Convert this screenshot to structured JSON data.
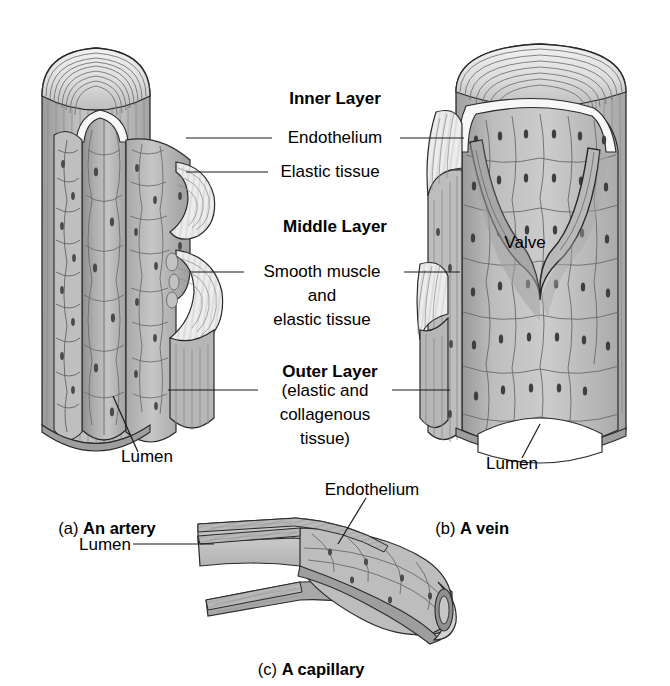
{
  "figure": {
    "background_color": "#ffffff",
    "line_color": "#1a1a1a",
    "fill_light": "#d8d8d8",
    "fill_mid": "#bdbdbd",
    "fill_dark": "#9c9c9c",
    "fill_darker": "#858585",
    "fill_white": "#f4f4f4"
  },
  "center_labels": {
    "inner_layer": "Inner Layer",
    "endothelium": "Endothelium",
    "elastic_tissue": "Elastic tissue",
    "middle_layer": "Middle Layer",
    "smooth_muscle_line1": "Smooth muscle",
    "smooth_muscle_line2": "and",
    "smooth_muscle_line3": "elastic tissue",
    "outer_layer": "Outer Layer",
    "outer_layer_sub1": "(elastic and",
    "outer_layer_sub2": "collagenous",
    "outer_layer_sub3": "tissue)"
  },
  "artery": {
    "lumen_label": "Lumen",
    "caption_prefix": "(a)",
    "caption_name": "An artery"
  },
  "vein": {
    "valve_label": "Valve",
    "lumen_label": "Lumen",
    "caption_prefix": "(b)",
    "caption_name": "A vein"
  },
  "capillary": {
    "lumen_label": "Lumen",
    "endothelium_label": "Endothelium",
    "caption_prefix": "(c)",
    "caption_name": "A capillary"
  }
}
